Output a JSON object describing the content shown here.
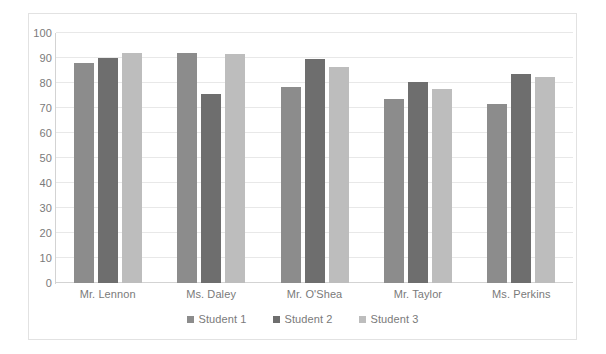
{
  "chart_data": {
    "type": "bar",
    "title": "",
    "subtitle": "",
    "xlabel": "",
    "ylabel": "",
    "categories": [
      "Mr. Lennon",
      "Ms. Daley",
      "Mr. O'Shea",
      "Mr. Taylor",
      "Ms. Perkins"
    ],
    "series": [
      {
        "name": "Student 1",
        "color": "#8c8c8c",
        "values": [
          88,
          92,
          78.5,
          73.5,
          71.5
        ]
      },
      {
        "name": "Student 2",
        "color": "#6e6e6e",
        "values": [
          90,
          75.5,
          89.5,
          80.5,
          83.5
        ]
      },
      {
        "name": "Student 3",
        "color": "#bdbdbd",
        "values": [
          92,
          91.5,
          86.5,
          77.5,
          82.5
        ]
      }
    ],
    "ylim": [
      0,
      100
    ],
    "ytick_step": 10,
    "yticks": [
      0,
      10,
      20,
      30,
      40,
      50,
      60,
      70,
      80,
      90,
      100
    ],
    "ytick_labels": [
      "0",
      "10",
      "20",
      "30",
      "40",
      "50",
      "60",
      "70",
      "80",
      "90",
      "100"
    ],
    "grid": {
      "horizontal": true,
      "vertical": false
    },
    "legend": {
      "position": "bottom",
      "entries": [
        "Student 1",
        "Student 2",
        "Student 3"
      ]
    },
    "colors": {
      "grid": "#e8e8e8",
      "axis": "#d3d3d3",
      "frame": "#e2e2e2",
      "text": "#7a7a7a",
      "background": "#ffffff"
    }
  }
}
